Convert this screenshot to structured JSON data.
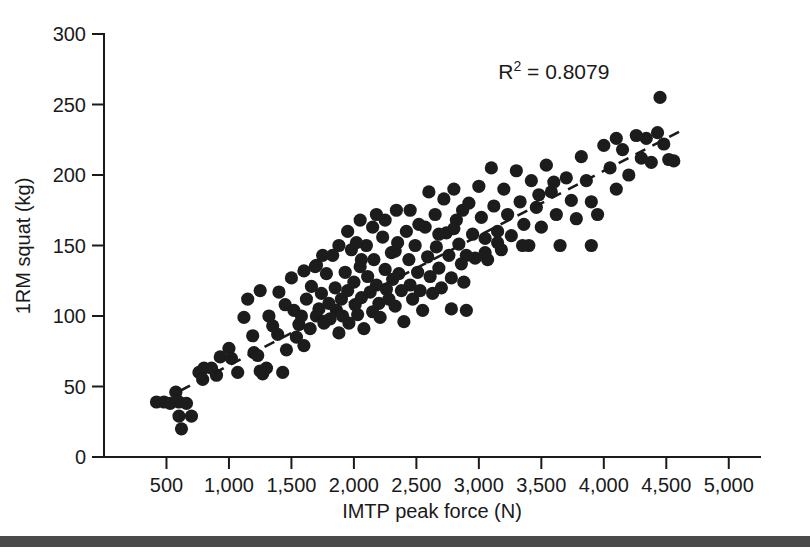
{
  "chart_data": {
    "type": "scatter",
    "title": "",
    "xlabel": "IMTP peak force (N)",
    "ylabel": "1RM squat (kg)",
    "xlim": [
      0,
      5250
    ],
    "ylim": [
      0,
      300
    ],
    "xticks": [
      500,
      1000,
      1500,
      2000,
      2500,
      3000,
      3500,
      4000,
      4500,
      5000
    ],
    "xtick_labels": [
      "500",
      "1,000",
      "1,500",
      "2,000",
      "2,500",
      "3,000",
      "3,500",
      "4,000",
      "4,500",
      "5,000"
    ],
    "yticks": [
      0,
      50,
      100,
      150,
      200,
      250,
      300
    ],
    "ytick_labels": [
      "0",
      "50",
      "100",
      "150",
      "200",
      "250",
      "300"
    ],
    "grid": false,
    "legend": false,
    "marker_color": "#1c1c1c",
    "annotations": [
      {
        "name": "r-squared",
        "text": "R2 = 0.8079",
        "base": "R",
        "superscript": "2",
        "rest": " = 0.8079",
        "x": 3600,
        "y": 268
      }
    ],
    "trendline": {
      "style": "dashed",
      "color": "#1a1a1a",
      "x": [
        610,
        4610
      ],
      "y": [
        47,
        231
      ]
    },
    "series": [
      {
        "name": "Athletes",
        "points": [
          [
            420,
            39
          ],
          [
            480,
            39
          ],
          [
            530,
            38
          ],
          [
            575,
            46
          ],
          [
            600,
            39
          ],
          [
            620,
            20
          ],
          [
            600,
            29
          ],
          [
            660,
            38
          ],
          [
            700,
            29
          ],
          [
            760,
            60
          ],
          [
            800,
            63
          ],
          [
            790,
            55
          ],
          [
            860,
            63
          ],
          [
            900,
            58
          ],
          [
            930,
            71
          ],
          [
            1000,
            77
          ],
          [
            1020,
            70
          ],
          [
            1070,
            60
          ],
          [
            1120,
            99
          ],
          [
            1150,
            112
          ],
          [
            1190,
            86
          ],
          [
            1200,
            74
          ],
          [
            1230,
            72
          ],
          [
            1250,
            61
          ],
          [
            1270,
            59
          ],
          [
            1300,
            63
          ],
          [
            1320,
            100
          ],
          [
            1350,
            93
          ],
          [
            1390,
            87
          ],
          [
            1400,
            117
          ],
          [
            1430,
            60
          ],
          [
            1460,
            76
          ],
          [
            1500,
            127
          ],
          [
            1520,
            104
          ],
          [
            1540,
            85
          ],
          [
            1560,
            94
          ],
          [
            1580,
            100
          ],
          [
            1600,
            79
          ],
          [
            1620,
            112
          ],
          [
            1650,
            91
          ],
          [
            1660,
            121
          ],
          [
            1690,
            135
          ],
          [
            1700,
            100
          ],
          [
            1720,
            105
          ],
          [
            1740,
            116
          ],
          [
            1760,
            95
          ],
          [
            1780,
            130
          ],
          [
            1800,
            109
          ],
          [
            1810,
            98
          ],
          [
            1830,
            143
          ],
          [
            1850,
            120
          ],
          [
            1860,
            104
          ],
          [
            1880,
            88
          ],
          [
            1900,
            112
          ],
          [
            1910,
            100
          ],
          [
            1930,
            131
          ],
          [
            1950,
            118
          ],
          [
            1960,
            95
          ],
          [
            1980,
            147
          ],
          [
            2000,
            124
          ],
          [
            2010,
            108
          ],
          [
            2030,
            101
          ],
          [
            2050,
            135
          ],
          [
            2060,
            113
          ],
          [
            2080,
            91
          ],
          [
            2100,
            150
          ],
          [
            2110,
            128
          ],
          [
            2130,
            117
          ],
          [
            2150,
            103
          ],
          [
            2160,
            140
          ],
          [
            2180,
            122
          ],
          [
            2200,
            109
          ],
          [
            2210,
            99
          ],
          [
            2230,
            156
          ],
          [
            2250,
            133
          ],
          [
            2260,
            119
          ],
          [
            2280,
            112
          ],
          [
            2300,
            145
          ],
          [
            2310,
            126
          ],
          [
            2330,
            107
          ],
          [
            2350,
            152
          ],
          [
            2360,
            130
          ],
          [
            2380,
            118
          ],
          [
            2400,
            96
          ],
          [
            2420,
            160
          ],
          [
            2440,
            140
          ],
          [
            2450,
            122
          ],
          [
            2470,
            112
          ],
          [
            2490,
            150
          ],
          [
            2510,
            131
          ],
          [
            2530,
            118
          ],
          [
            2550,
            104
          ],
          [
            2570,
            163
          ],
          [
            2590,
            142
          ],
          [
            2610,
            128
          ],
          [
            2630,
            116
          ],
          [
            2650,
            172
          ],
          [
            2660,
            149
          ],
          [
            2680,
            134
          ],
          [
            2700,
            120
          ],
          [
            2720,
            183
          ],
          [
            2740,
            159
          ],
          [
            2760,
            143
          ],
          [
            2780,
            127
          ],
          [
            2800,
            190
          ],
          [
            2820,
            168
          ],
          [
            2840,
            151
          ],
          [
            2860,
            137
          ],
          [
            2880,
            124
          ],
          [
            2900,
            104
          ],
          [
            2920,
            180
          ],
          [
            2950,
            158
          ],
          [
            2970,
            141
          ],
          [
            3000,
            192
          ],
          [
            3020,
            170
          ],
          [
            3050,
            155
          ],
          [
            3070,
            140
          ],
          [
            3100,
            205
          ],
          [
            3120,
            178
          ],
          [
            3150,
            160
          ],
          [
            3180,
            147
          ],
          [
            3200,
            190
          ],
          [
            3230,
            172
          ],
          [
            3260,
            157
          ],
          [
            3300,
            203
          ],
          [
            3330,
            181
          ],
          [
            3360,
            165
          ],
          [
            3400,
            150
          ],
          [
            3420,
            196
          ],
          [
            3460,
            177
          ],
          [
            3500,
            163
          ],
          [
            3540,
            207
          ],
          [
            3580,
            188
          ],
          [
            3620,
            172
          ],
          [
            3650,
            150
          ],
          [
            3700,
            198
          ],
          [
            3740,
            182
          ],
          [
            3780,
            169
          ],
          [
            3820,
            213
          ],
          [
            3860,
            196
          ],
          [
            3900,
            181
          ],
          [
            3950,
            172
          ],
          [
            4000,
            221
          ],
          [
            4050,
            205
          ],
          [
            4100,
            190
          ],
          [
            4150,
            218
          ],
          [
            4200,
            200
          ],
          [
            4260,
            228
          ],
          [
            4300,
            212
          ],
          [
            4340,
            226
          ],
          [
            4380,
            209
          ],
          [
            4430,
            230
          ],
          [
            4450,
            255
          ],
          [
            4480,
            222
          ],
          [
            4520,
            211
          ],
          [
            4560,
            210
          ],
          [
            2050,
            168
          ],
          [
            2180,
            172
          ],
          [
            2340,
            175
          ],
          [
            1950,
            160
          ],
          [
            2600,
            188
          ],
          [
            1600,
            132
          ],
          [
            1750,
            143
          ],
          [
            2900,
            143
          ],
          [
            3050,
            145
          ],
          [
            2780,
            105
          ],
          [
            2450,
            175
          ],
          [
            2520,
            165
          ],
          [
            1880,
            150
          ],
          [
            2020,
            152
          ],
          [
            2150,
            163
          ],
          [
            2680,
            158
          ],
          [
            3350,
            150
          ],
          [
            3150,
            152
          ],
          [
            2250,
            168
          ],
          [
            1450,
            108
          ],
          [
            1250,
            118
          ],
          [
            2060,
            140
          ],
          [
            2330,
            146
          ],
          [
            1700,
            136
          ],
          [
            2800,
            162
          ],
          [
            2870,
            175
          ],
          [
            3480,
            186
          ],
          [
            3600,
            195
          ],
          [
            4100,
            226
          ],
          [
            3900,
            150
          ]
        ]
      }
    ]
  },
  "figure": {
    "background": "#ffffff",
    "bottom_bar_color": "#4a4a4a"
  }
}
